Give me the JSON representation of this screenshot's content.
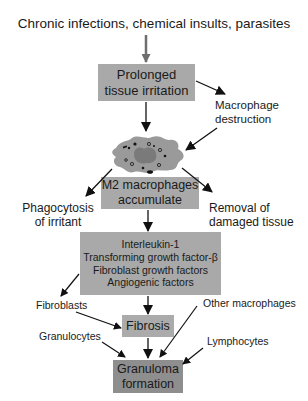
{
  "diagram": {
    "title": "Chronic infections, chemical insults, parasites",
    "nodes": {
      "prolonged_irritation": {
        "lines": [
          "Prolonged",
          "tissue irritation"
        ]
      },
      "macrophage_destruction": {
        "lines": [
          "Macrophage",
          "destruction"
        ]
      },
      "macrophage_cell": {
        "icon": "macrophage-cell-illustration"
      },
      "m2_macrophages": {
        "lines": [
          "M2 macrophages",
          "accumulate"
        ]
      },
      "phagocytosis": {
        "lines": [
          "Phagocytosis",
          "of irritant"
        ]
      },
      "removal": {
        "lines": [
          "Removal of",
          "damaged tissue"
        ]
      },
      "cytokines": {
        "lines": [
          "Interleukin-1",
          "Transforming growth factor-β",
          "Fibroblast growth factors",
          "Angiogenic factors"
        ]
      },
      "fibroblasts": {
        "label": "Fibroblasts"
      },
      "other_macrophages": {
        "label": "Other macrophages"
      },
      "fibrosis": {
        "label": "Fibrosis"
      },
      "granulocytes": {
        "label": "Granulocytes"
      },
      "lymphocytes": {
        "label": "Lymphocytes"
      },
      "granuloma": {
        "lines": [
          "Granuloma",
          "formation"
        ]
      }
    },
    "colors": {
      "box_fill": "#a9a9a9",
      "box_fill_dark": "#8e8e8e",
      "arrow": "#111111",
      "arrow_gray": "#6e6e6e",
      "cell_body": "#9a9a9a",
      "cell_nucleus": "#7a7a7a"
    }
  }
}
